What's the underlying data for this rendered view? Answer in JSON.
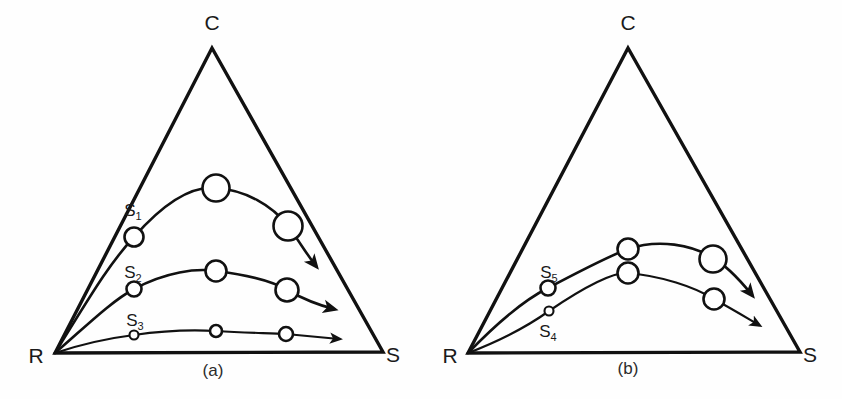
{
  "figure": {
    "background_color": "#fefefe",
    "ink_color": "#111111",
    "width": 842,
    "height": 399
  },
  "panels": [
    {
      "id": "a",
      "caption": "(a)",
      "caption_pos": {
        "x": 213,
        "y": 376
      },
      "triangle": {
        "C": {
          "x": 212,
          "y": 48
        },
        "R": {
          "x": 55,
          "y": 353
        },
        "S": {
          "x": 383,
          "y": 352
        }
      },
      "vertex_labels": [
        {
          "name": "C",
          "text": "C",
          "x": 212,
          "y": 30
        },
        {
          "name": "R",
          "text": "R",
          "x": 36,
          "y": 363
        },
        {
          "name": "S",
          "text": "S",
          "x": 393,
          "y": 362
        }
      ],
      "trajectories": [
        {
          "id": "S1",
          "label": "S",
          "subscript": "1",
          "label_pos": {
            "x": 133,
            "y": 216
          },
          "path": "M 55 353 C 88 300 108 265 134 237 C 170 196 196 186 216 188 C 245 190 272 205 288 226 C 299 241 308 256 316 266",
          "arrow_tip": {
            "x": 320,
            "y": 271
          },
          "nodes": [
            {
              "x": 134,
              "y": 237,
              "r": 9.5
            },
            {
              "x": 216,
              "y": 188,
              "r": 13.5
            },
            {
              "x": 288,
              "y": 226,
              "r": 14.5
            }
          ]
        },
        {
          "id": "S2",
          "label": "S",
          "subscript": "2",
          "label_pos": {
            "x": 133,
            "y": 278
          },
          "path": "M 55 353 C 82 330 110 302 134 289 C 166 272 196 268 216 271 C 248 275 274 282 287 290 C 305 300 322 306 334 309",
          "arrow_tip": {
            "x": 341,
            "y": 311
          },
          "nodes": [
            {
              "x": 134,
              "y": 289,
              "r": 7.5
            },
            {
              "x": 216,
              "y": 271,
              "r": 10.5
            },
            {
              "x": 287,
              "y": 290,
              "r": 11.5
            }
          ]
        },
        {
          "id": "S3",
          "label": "S",
          "subscript": "3",
          "label_pos": {
            "x": 135,
            "y": 326
          },
          "path": "M 55 353 C 82 344 110 338 134 335 C 168 330 198 330 216 331 C 248 333 272 333 286 334 C 308 336 328 338 339 339",
          "arrow_tip": {
            "x": 346,
            "y": 340
          },
          "nodes": [
            {
              "x": 134,
              "y": 335,
              "r": 4.5
            },
            {
              "x": 216,
              "y": 331,
              "r": 6.0
            },
            {
              "x": 286,
              "y": 334,
              "r": 7.0
            }
          ]
        }
      ]
    },
    {
      "id": "b",
      "caption": "(b)",
      "caption_pos": {
        "x": 628,
        "y": 374
      },
      "triangle": {
        "C": {
          "x": 628,
          "y": 48
        },
        "R": {
          "x": 468,
          "y": 353
        },
        "S": {
          "x": 800,
          "y": 352
        }
      },
      "vertex_labels": [
        {
          "name": "C",
          "text": "C",
          "x": 628,
          "y": 30
        },
        {
          "name": "R",
          "text": "R",
          "x": 450,
          "y": 363
        },
        {
          "name": "S",
          "text": "S",
          "x": 810,
          "y": 362
        }
      ],
      "trajectories": [
        {
          "id": "S5",
          "label": "S",
          "subscript": "5",
          "label_pos": {
            "x": 549,
            "y": 278
          },
          "path": "M 468 353 C 498 322 524 300 548 288 C 582 270 612 255 628 249 C 660 238 692 246 710 256 C 728 266 744 285 752 295",
          "arrow_tip": {
            "x": 758,
            "y": 302
          },
          "nodes": [
            {
              "x": 548,
              "y": 288,
              "r": 7.5
            },
            {
              "x": 628,
              "y": 249,
              "r": 10.5
            },
            {
              "x": 713,
              "y": 259,
              "r": 13.5
            }
          ]
        },
        {
          "id": "S4",
          "label": "S",
          "subscript": "4",
          "label_pos": {
            "x": 548,
            "y": 337
          },
          "path": "M 468 353 C 502 340 528 326 549 311 C 580 290 612 272 628 273 C 662 276 694 287 712 298 C 734 310 752 321 759 325",
          "arrow_tip": {
            "x": 766,
            "y": 328
          },
          "nodes": [
            {
              "x": 549,
              "y": 311,
              "r": 4.5
            },
            {
              "x": 628,
              "y": 273,
              "r": 10.5
            },
            {
              "x": 714,
              "y": 299,
              "r": 10.5
            }
          ]
        }
      ]
    }
  ]
}
